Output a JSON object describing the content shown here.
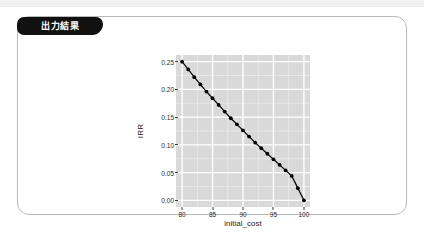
{
  "window": {
    "top_band_color": "#f2f2f2",
    "background": "#ffffff"
  },
  "card": {
    "tab_label": "出力結果",
    "tab_background": "#111111",
    "tab_text_color": "#ffffff",
    "border_color": "#b9b9b9"
  },
  "chart_data": {
    "type": "line",
    "title": "",
    "subtitle": "",
    "xlabel": "initial_cost",
    "ylabel": "IRR",
    "xlim": [
      79.0,
      101.0
    ],
    "ylim": [
      -0.012,
      0.262
    ],
    "xticks": [
      80,
      85,
      90,
      95,
      100
    ],
    "xtick_labels": [
      "80",
      "85",
      "90",
      "95",
      "100"
    ],
    "yticks": [
      0.0,
      0.05,
      0.1,
      0.15,
      0.2,
      0.25
    ],
    "ytick_labels": [
      "0.00",
      "0.05",
      "0.10",
      "0.15",
      "0.20",
      "0.25"
    ],
    "grid": true,
    "grid_major_color": "#ffffff",
    "grid_minor_color": "#ececec",
    "panel_background": "#d9d9d9",
    "legend": null,
    "legend_position": "none",
    "marker": "circle",
    "marker_color": "#000000",
    "line_color": "#000000",
    "series": [
      {
        "name": "IRR",
        "x": [
          80,
          81,
          82,
          83,
          84,
          85,
          86,
          87,
          88,
          89,
          90,
          91,
          92,
          93,
          94,
          95,
          96,
          97,
          98,
          99,
          100
        ],
        "values": [
          0.25,
          0.236,
          0.222,
          0.209,
          0.196,
          0.184,
          0.172,
          0.16,
          0.148,
          0.137,
          0.126,
          0.115,
          0.104,
          0.094,
          0.084,
          0.074,
          0.064,
          0.054,
          0.044,
          0.022,
          0.0
        ]
      }
    ]
  }
}
